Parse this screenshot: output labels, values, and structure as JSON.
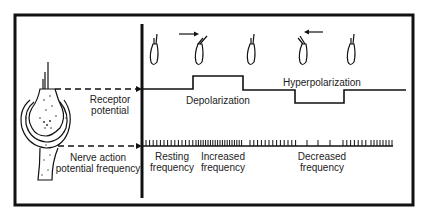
{
  "diagram": {
    "left_labels": {
      "receptor_potential": [
        "Receptor",
        "potential"
      ],
      "nerve_action": [
        "Nerve action",
        "potential frequency"
      ]
    },
    "potential_labels": {
      "depolarization": "Depolarization",
      "hyperpolarization": "Hyperpolarization"
    },
    "frequency_labels": {
      "resting": [
        "Resting",
        "frequency"
      ],
      "increased": [
        "Increased",
        "frequency"
      ],
      "decreased": [
        "Decreased",
        "frequency"
      ]
    },
    "hair_cells": [
      {
        "state": "rest",
        "arrow": null
      },
      {
        "state": "deflected-toward-kinocilium",
        "arrow": "right"
      },
      {
        "state": "rest",
        "arrow": null
      },
      {
        "state": "deflected-away-from-kinocilium",
        "arrow": "left"
      },
      {
        "state": "rest",
        "arrow": null
      }
    ],
    "colors": {
      "ink": "#111111",
      "background": "#ffffff"
    }
  }
}
